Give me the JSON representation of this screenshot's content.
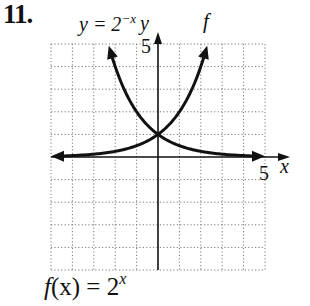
{
  "problem": {
    "number": "11."
  },
  "caption": {
    "prefix": "f",
    "arg": "(x)",
    "equals": " = 2",
    "exponent": "x"
  },
  "chart_data": {
    "type": "line",
    "title": "",
    "xlabel": "x",
    "ylabel": "y",
    "xlim": [
      -5,
      5
    ],
    "ylim": [
      -5,
      5
    ],
    "grid": true,
    "grid_style": "dotted",
    "tick_labels": {
      "x": [
        "5"
      ],
      "y": [
        "5"
      ]
    },
    "series": [
      {
        "name": "f",
        "label": "f",
        "equation": "f(x) = 2^x",
        "x": [
          -5,
          -4,
          -3,
          -2,
          -1,
          0,
          1,
          2,
          2.3
        ],
        "y": [
          0.03,
          0.06,
          0.13,
          0.25,
          0.5,
          1,
          2,
          4,
          4.92
        ]
      },
      {
        "name": "y = 2^-x",
        "label": "y = 2^{-x}",
        "equation": "y = 2^(-x)",
        "x": [
          -2.3,
          -2,
          -1,
          0,
          1,
          2,
          3,
          4,
          5
        ],
        "y": [
          4.92,
          4,
          2,
          1,
          0.5,
          0.25,
          0.13,
          0.06,
          0.03
        ]
      }
    ],
    "annotations": [
      "y = 2^-x",
      "f",
      "y",
      "x",
      "5",
      "5"
    ],
    "legend": null,
    "caption": "f(x) = 2^x"
  },
  "labels": {
    "curve2_base": "y = 2",
    "curve2_exp": "−x",
    "curve1": "f",
    "y_axis": "y",
    "x_axis": "x",
    "y_tick": "5",
    "x_tick": "5"
  }
}
